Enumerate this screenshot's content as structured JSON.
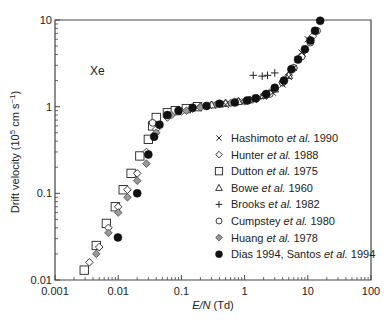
{
  "chart_data": {
    "type": "scatter",
    "title": "",
    "annotation": "Xe",
    "xlabel": "E/N (Td)",
    "xlabel_parts": {
      "italic": "E/N",
      "normal": " (Td)"
    },
    "ylabel": "Drift velocity (10^5 cm s^-1)",
    "ylabel_parts": {
      "pre": "Drift velocity (10",
      "sup1": "5",
      "mid": " cm s",
      "sup2": "−1",
      "post": ")"
    },
    "xscale": "log",
    "yscale": "log",
    "xlim": [
      0.001,
      100
    ],
    "ylim": [
      0.01,
      10
    ],
    "x_ticks": [
      "0.001",
      "0.01",
      "0.1",
      "1",
      "10",
      "100"
    ],
    "y_ticks": [
      "0.01",
      "0.1",
      "1",
      "10"
    ],
    "grid": false,
    "legend_position": "center-right",
    "series": [
      {
        "name": "Hashimoto et al. 1990",
        "author": "Hashimoto",
        "year": "1990",
        "marker": "x",
        "x": [
          0.5,
          0.7,
          1.0,
          1.4,
          2.0,
          2.8,
          4.0,
          5.0,
          6.0,
          7.0,
          8.0,
          10.0
        ],
        "y": [
          1.05,
          1.1,
          1.15,
          1.2,
          1.3,
          1.45,
          1.8,
          2.2,
          2.8,
          3.5,
          4.2,
          6.0
        ]
      },
      {
        "name": "Hunter et al. 1988",
        "author": "Hunter",
        "year": "1988",
        "marker": "diamond-open",
        "x": [
          0.0035,
          0.005,
          0.007,
          0.01,
          0.014,
          0.02,
          0.028,
          0.04,
          0.06,
          0.1,
          0.15,
          0.2,
          0.3,
          0.5,
          0.8,
          1.2,
          2.0,
          3.0,
          5.0,
          8.0,
          12.0
        ],
        "y": [
          0.016,
          0.024,
          0.04,
          0.07,
          0.11,
          0.17,
          0.3,
          0.55,
          0.75,
          0.88,
          0.95,
          1.0,
          1.05,
          1.1,
          1.15,
          1.2,
          1.35,
          1.6,
          2.3,
          3.8,
          6.5
        ]
      },
      {
        "name": "Dutton et al. 1975",
        "author": "Dutton",
        "year": "1975",
        "marker": "square-open",
        "x": [
          0.0029,
          0.0045,
          0.0065,
          0.009,
          0.012,
          0.016,
          0.022,
          0.03,
          0.035,
          0.04,
          0.06,
          0.08,
          0.12,
          0.18
        ],
        "y": [
          0.013,
          0.025,
          0.045,
          0.07,
          0.11,
          0.17,
          0.27,
          0.42,
          0.6,
          0.75,
          0.85,
          0.9,
          0.95,
          1.0
        ]
      },
      {
        "name": "Bowe et al. 1960",
        "author": "Bowe",
        "year": "1960",
        "marker": "triangle-open",
        "x": [
          0.3,
          0.5,
          0.8,
          1.2,
          2.0,
          3.0,
          5.0
        ],
        "y": [
          1.05,
          1.1,
          1.15,
          1.2,
          1.35,
          1.6,
          2.3
        ]
      },
      {
        "name": "Brooks et al. 1982",
        "author": "Brooks",
        "year": "1982",
        "marker": "plus",
        "x": [
          1.37,
          1.9,
          2.3,
          3.0
        ],
        "y": [
          2.3,
          2.25,
          2.3,
          2.45
        ]
      },
      {
        "name": "Cumpstey et al. 1980",
        "author": "Cumpstey",
        "year": "1980",
        "marker": "circle-open",
        "x": [
          0.035,
          2.5,
          4.0,
          6.0,
          8.0,
          11.0,
          14.0
        ],
        "y": [
          0.65,
          1.4,
          1.9,
          2.8,
          3.8,
          5.5,
          7.5
        ]
      },
      {
        "name": "Huang et al. 1978",
        "author": "Huang",
        "year": "1978",
        "marker": "diamond-gray",
        "x": [
          0.0045,
          0.007,
          0.01,
          0.014,
          0.02,
          0.028,
          0.04,
          0.07,
          0.12,
          0.2,
          0.35,
          0.6,
          1.0,
          1.6,
          2.5,
          4.0,
          6.0,
          9.0
        ],
        "y": [
          0.02,
          0.035,
          0.06,
          0.09,
          0.14,
          0.22,
          0.5,
          0.8,
          0.9,
          0.98,
          1.05,
          1.1,
          1.15,
          1.25,
          1.45,
          1.9,
          2.8,
          4.5
        ]
      },
      {
        "name": "Dias 1994, Santos et al. 1994",
        "author": "Dias 1994, Santos",
        "year": "1994",
        "marker": "circle-filled",
        "x": [
          0.0099,
          0.02,
          0.03,
          0.037,
          0.045,
          0.06,
          0.09,
          0.15,
          0.25,
          0.4,
          0.7,
          1.1,
          1.5,
          2.2,
          3.0,
          4.2,
          5.5,
          7.0,
          9.0,
          11.0,
          13.0,
          15.7
        ],
        "y": [
          0.031,
          0.1,
          0.28,
          0.45,
          0.62,
          0.8,
          0.9,
          0.97,
          1.02,
          1.08,
          1.12,
          1.18,
          1.25,
          1.4,
          1.65,
          2.0,
          2.7,
          3.5,
          4.6,
          5.8,
          7.5,
          9.8
        ]
      }
    ]
  },
  "legend": {
    "items": [
      {
        "pre": "Hashimoto ",
        "etal": "et al.",
        "post": " 1990",
        "marker": "x"
      },
      {
        "pre": "Hunter ",
        "etal": "et al.",
        "post": " 1988",
        "marker": "diamond-open"
      },
      {
        "pre": "Dutton ",
        "etal": "et al.",
        "post": " 1975",
        "marker": "square-open"
      },
      {
        "pre": "Bowe ",
        "etal": "et al.",
        "post": " 1960",
        "marker": "triangle-open"
      },
      {
        "pre": "Brooks ",
        "etal": "et al.",
        "post": " 1982",
        "marker": "plus"
      },
      {
        "pre": "Cumpstey ",
        "etal": "et al.",
        "post": " 1980",
        "marker": "circle-open"
      },
      {
        "pre": "Huang ",
        "etal": "et al.",
        "post": " 1978",
        "marker": "diamond-gray"
      },
      {
        "pre": "Dias 1994, Santos ",
        "etal": "et al.",
        "post": " 1994",
        "marker": "circle-filled"
      }
    ]
  },
  "colors": {
    "axis": "#444444",
    "marker_stroke": "#222222",
    "gray_fill": "#999999",
    "filled": "#111111"
  }
}
